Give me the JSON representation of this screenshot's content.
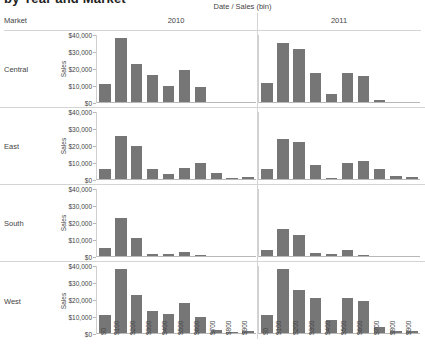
{
  "title_clipped": "by Year and Market",
  "header": {
    "column_field_label": "Date  /  Sales (bin)",
    "row_field_label": "Market",
    "columns": [
      "2010",
      "2011"
    ]
  },
  "axis": {
    "y_title": "Sales",
    "y_ticks": [
      "$40,000",
      "$30,000",
      "$20,000",
      "$10,000",
      "$0"
    ],
    "x_ticks": [
      "$0",
      "$100",
      "$200",
      "$300",
      "$400",
      "$500",
      "$600",
      "$700",
      "$800",
      "$900"
    ]
  },
  "colors": {
    "bar": "#767676",
    "grid": "#d4d4d4",
    "axis": "#b8b8b8",
    "text": "#444444"
  },
  "chart_data": {
    "type": "bar",
    "title": "by Year and Market",
    "xlabel": "Sales (bin)",
    "ylabel": "Sales",
    "ylim": [
      0,
      42000
    ],
    "grid": false,
    "legend": "none",
    "layout": "small-multiples 4 rows (Market) x 2 columns (Date year)",
    "categories": [
      "$0",
      "$100",
      "$200",
      "$300",
      "$400",
      "$500",
      "$600",
      "$700",
      "$800",
      "$900"
    ],
    "rows": [
      "Central",
      "East",
      "South",
      "West"
    ],
    "columns": [
      "2010",
      "2011"
    ],
    "panels": [
      {
        "row": "Central",
        "column": "2010",
        "values": [
          11000,
          40000,
          24000,
          17000,
          10000,
          20000,
          9500,
          0,
          0,
          0
        ]
      },
      {
        "row": "Central",
        "column": "2011",
        "values": [
          12000,
          37000,
          33000,
          18000,
          5000,
          18000,
          16000,
          1000,
          0,
          0
        ]
      },
      {
        "row": "East",
        "column": "2010",
        "values": [
          6000,
          27000,
          21000,
          6000,
          3000,
          7000,
          10000,
          3500,
          300,
          1500
        ]
      },
      {
        "row": "East",
        "column": "2011",
        "values": [
          6000,
          25000,
          23000,
          9000,
          500,
          10000,
          11000,
          6000,
          2000,
          1000
        ]
      },
      {
        "row": "South",
        "column": "2010",
        "values": [
          5000,
          24000,
          11000,
          1500,
          1500,
          2500,
          500,
          0,
          0,
          0
        ]
      },
      {
        "row": "South",
        "column": "2011",
        "values": [
          4000,
          17000,
          13000,
          2000,
          1500,
          4000,
          500,
          0,
          0,
          0
        ]
      },
      {
        "row": "West",
        "column": "2010",
        "values": [
          11000,
          40000,
          24000,
          14000,
          12000,
          19000,
          10000,
          2000,
          300,
          1000
        ]
      },
      {
        "row": "West",
        "column": "2011",
        "values": [
          11000,
          40000,
          27000,
          22000,
          8000,
          22000,
          20000,
          4000,
          1500,
          1500
        ]
      }
    ]
  }
}
